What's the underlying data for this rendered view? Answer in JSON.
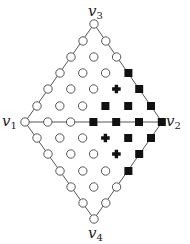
{
  "diagram": {
    "type": "triangulated-diamond-lattice",
    "colors": {
      "edge": "#555555",
      "circle_stroke": "#444444",
      "circle_fill": "#ffffff",
      "square_fill": "#111111",
      "cross_fill": "#111111"
    },
    "vertices": [
      {
        "id": "v1",
        "name": "v",
        "sub": "1",
        "x": 25,
        "y": 122,
        "label_x": 2,
        "label_y": 126
      },
      {
        "id": "v2",
        "name": "v",
        "sub": "2",
        "x": 162,
        "y": 122,
        "label_x": 166,
        "label_y": 126
      },
      {
        "id": "v3",
        "name": "v",
        "sub": "3",
        "x": 94,
        "y": 24,
        "label_x": 88,
        "label_y": 16
      },
      {
        "id": "v4",
        "name": "v",
        "sub": "4",
        "x": 94,
        "y": 219,
        "label_x": 88,
        "label_y": 238
      }
    ],
    "edges": [
      [
        "v1",
        "v3"
      ],
      [
        "v3",
        "v2"
      ],
      [
        "v2",
        "v4"
      ],
      [
        "v4",
        "v1"
      ],
      [
        "v1",
        "v2"
      ]
    ],
    "legend_markers": {
      "o": "open-circle",
      "s": "filled-square",
      "x": "filled-cross"
    },
    "rows": [
      {
        "y": 24,
        "x0": 94,
        "marks": "o"
      },
      {
        "y": 41,
        "x0": 83,
        "marks": "oo"
      },
      {
        "y": 57,
        "x0": 71,
        "marks": "ooo"
      },
      {
        "y": 73,
        "x0": 60,
        "marks": "ooos"
      },
      {
        "y": 89,
        "x0": 48,
        "marks": "oooxs"
      },
      {
        "y": 106,
        "x0": 37,
        "marks": "ooosss"
      },
      {
        "y": 122,
        "x0": 25,
        "marks": "ooossss"
      },
      {
        "y": 138,
        "x0": 37,
        "marks": "oooxss"
      },
      {
        "y": 154,
        "x0": 48,
        "marks": "oooxs"
      },
      {
        "y": 171,
        "x0": 60,
        "marks": "ooos"
      },
      {
        "y": 187,
        "x0": 71,
        "marks": "ooo"
      },
      {
        "y": 203,
        "x0": 83,
        "marks": "oo"
      },
      {
        "y": 219,
        "x0": 94,
        "marks": "o"
      }
    ],
    "dx": 22.8
  }
}
